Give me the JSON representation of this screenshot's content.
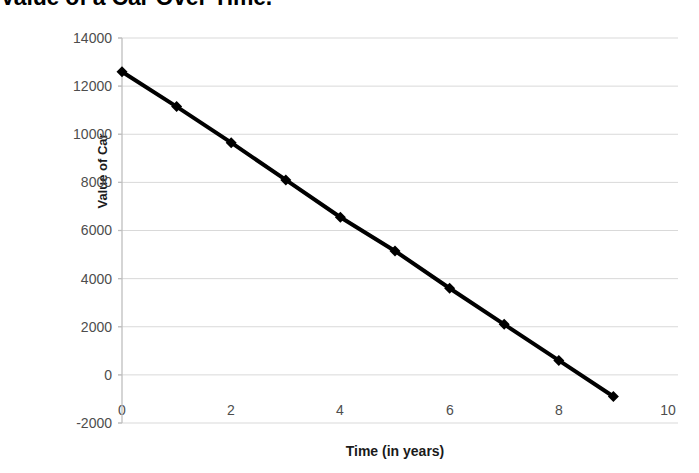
{
  "chart_data": {
    "type": "line",
    "title": "Value of a Car Over Time.",
    "title_visible_fragment": "ar Over Time.",
    "xlabel": "Time (in years)",
    "ylabel": "Value of Car",
    "x": [
      0,
      1,
      2,
      3,
      4,
      5,
      6,
      7,
      8,
      9
    ],
    "values": [
      12600,
      11150,
      9650,
      8100,
      6550,
      5150,
      3600,
      2100,
      600,
      -900
    ],
    "series": [
      {
        "name": "Value of Car",
        "values": [
          12600,
          11150,
          9650,
          8100,
          6550,
          5150,
          3600,
          2100,
          600,
          -900
        ]
      }
    ],
    "xlim": [
      0,
      10
    ],
    "ylim": [
      -2000,
      14000
    ],
    "xticks": [
      0,
      2,
      4,
      6,
      8,
      10
    ],
    "yticks": [
      14000,
      12000,
      10000,
      8000,
      6000,
      4000,
      2000,
      0,
      -2000
    ],
    "xtick_labels": [
      "0",
      "2",
      "4",
      "6",
      "8",
      "10"
    ],
    "ytick_labels": [
      "14000",
      "12000",
      "10000",
      "8000",
      "6000",
      "4000",
      "2000",
      "0",
      "-2000"
    ],
    "grid": "horizontal",
    "legend": "none",
    "marker": "diamond",
    "line_color": "#000000",
    "marker_color": "#000000",
    "grid_color": "#d9d9d9",
    "axis_color": "#bfbfbf",
    "tick_label_color": "#4d4d4d",
    "background_color": "#ffffff"
  }
}
